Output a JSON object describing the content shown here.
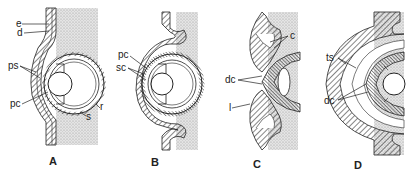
{
  "figure": {
    "type": "anatomical diagram",
    "colors": {
      "ink": "#222222",
      "stipple": "#c8c8c8",
      "background": "#ffffff"
    },
    "panels": [
      {
        "id": "A",
        "label": "A",
        "annotations": [
          "e",
          "d",
          "ps",
          "pc",
          "r",
          "s"
        ]
      },
      {
        "id": "B",
        "label": "B",
        "annotations": [
          "pc",
          "sc"
        ]
      },
      {
        "id": "C",
        "label": "C",
        "annotations": [
          "c",
          "dc",
          "l"
        ]
      },
      {
        "id": "D",
        "label": "D",
        "annotations": [
          "ts",
          "dc"
        ]
      }
    ]
  }
}
